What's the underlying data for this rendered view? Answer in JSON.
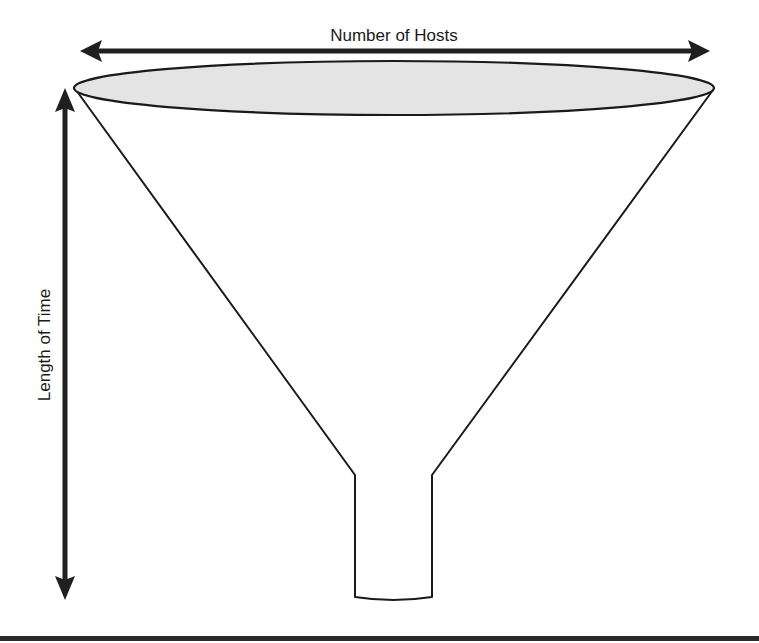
{
  "diagram": {
    "type": "funnel",
    "labels": {
      "horizontal_axis": "Number of Hosts",
      "vertical_axis": "Length of Time"
    },
    "colors": {
      "stroke": "#1a1a1a",
      "funnel_mouth_fill": "#e4e4e4",
      "arrow": "#1f1f1f",
      "background": "#ffffff"
    },
    "icons": {
      "horizontal_arrow": "double-headed-arrow-horizontal",
      "vertical_arrow": "double-headed-arrow-vertical"
    }
  }
}
